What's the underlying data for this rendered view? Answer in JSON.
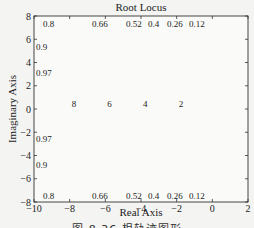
{
  "figure": {
    "caption": "图 8.36   根轨迹图形"
  },
  "chart_data": {
    "type": "line",
    "title": "Root Locus",
    "xlabel": "Real Axis",
    "ylabel": "Imaginary Axis",
    "xlim": [
      -10,
      2
    ],
    "ylim": [
      -8,
      8
    ],
    "xticks": [
      -10,
      -8,
      -6,
      -4,
      -2,
      0,
      2
    ],
    "yticks": [
      -8,
      -6,
      -4,
      -2,
      0,
      2,
      4,
      6,
      8
    ],
    "grid": true,
    "grid_type": "s-plane (constant damping rays and natural frequency arcs)",
    "damping_ratios": [
      0.12,
      0.26,
      0.4,
      0.52,
      0.66,
      0.8,
      0.9,
      0.97
    ],
    "damping_labels_top": [
      "0.8",
      "0.66",
      "0.52",
      "0.4",
      "0.26",
      "0.12"
    ],
    "damping_labels_left": [
      "0.8",
      "0.9",
      "0.97"
    ],
    "natural_frequencies": [
      2,
      4,
      6,
      8
    ],
    "natural_frequency_labels": [
      "8",
      "6",
      "4",
      "2"
    ],
    "poles": [
      {
        "re": 0,
        "im": 0
      },
      {
        "re": 0,
        "im": 0
      },
      {
        "re": 0,
        "im": 0
      }
    ],
    "zeros": [
      {
        "re": -2,
        "im": 0
      }
    ],
    "series": [
      {
        "name": "real-axis branch",
        "x": [
          -10,
          -2
        ],
        "y": [
          0,
          0
        ]
      },
      {
        "name": "upper branch",
        "x": [
          0,
          0.5,
          1.0,
          1.5,
          2.0
        ],
        "y": [
          0,
          2.6,
          4.6,
          6.2,
          7.5
        ]
      },
      {
        "name": "lower branch",
        "x": [
          0,
          0.5,
          1.0,
          1.5,
          2.0
        ],
        "y": [
          0,
          -2.6,
          -4.6,
          -6.2,
          -7.5
        ]
      }
    ]
  }
}
